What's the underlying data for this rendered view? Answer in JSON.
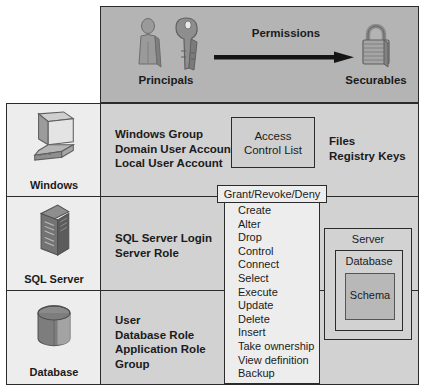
{
  "diagram": {
    "colors": {
      "top_band": "#b4b4b4",
      "main_area": "#d2d2d2",
      "icon_column": "#ededed",
      "panel": "#ededed",
      "schema_fill": "#b8b8b8",
      "line": "#2b2b2b"
    }
  },
  "top_band": {
    "principals_label": "Principals",
    "securables_label": "Securables",
    "arrow_label": "Permissions",
    "icons": {
      "person": "person-icon",
      "keys": "keys-icon",
      "lock": "padlock-icon",
      "arrow": "arrow-right-icon"
    }
  },
  "rows": [
    {
      "id": "windows",
      "icon_label": "Windows",
      "icon_name": "computer-icon",
      "principals": "Windows Group\nDomain User Account\nLocal User Account",
      "securables": "Files\nRegistry Keys"
    },
    {
      "id": "sql-server",
      "icon_label": "SQL Server",
      "icon_name": "server-tower-icon",
      "principals": "SQL Server Login\nServer Role",
      "securables": ""
    },
    {
      "id": "database",
      "icon_label": "Database",
      "icon_name": "database-cylinder-icon",
      "principals": "User\nDatabase Role\nApplication Role\nGroup",
      "securables": ""
    }
  ],
  "acl_box": {
    "label": "Access\nControl List"
  },
  "grant_tab": {
    "label": "Grant/Revoke/Deny"
  },
  "permissions": {
    "items": [
      "Create",
      "Alter",
      "Drop",
      "Control",
      "Connect",
      "Select",
      "Execute",
      "Update",
      "Delete",
      "Insert",
      "Take ownership",
      "View definition",
      "Backup"
    ]
  },
  "nested_securables": {
    "server_label": "Server",
    "database_label": "Database",
    "schema_label": "Schema"
  }
}
